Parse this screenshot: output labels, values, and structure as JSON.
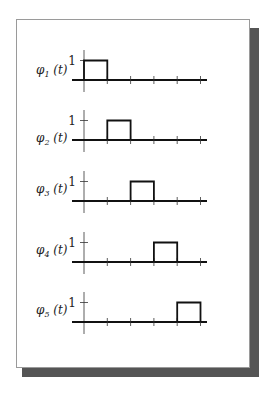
{
  "figure": {
    "colors": {
      "shadow": "#555555",
      "card_border": "#9a9a9a",
      "line": "#111111",
      "axis": "#333333"
    }
  },
  "chart_data": {
    "type": "line",
    "title": "",
    "x_ticks": 5,
    "ylim": [
      0,
      1
    ],
    "series": [
      {
        "name": "φ1 (t)",
        "symbol": "φ",
        "sub": "1",
        "arg": " (t)",
        "y_tick_label": "1",
        "pulse_start": 0,
        "pulse_end": 1,
        "height": 1
      },
      {
        "name": "φ2 (t)",
        "symbol": "φ",
        "sub": "2",
        "arg": " (t)",
        "y_tick_label": "1",
        "pulse_start": 1,
        "pulse_end": 2,
        "height": 1
      },
      {
        "name": "φ3 (t)",
        "symbol": "φ",
        "sub": "3",
        "arg": " (t)",
        "y_tick_label": "1",
        "pulse_start": 2,
        "pulse_end": 3,
        "height": 1
      },
      {
        "name": "φ4 (t)",
        "symbol": "φ",
        "sub": "4",
        "arg": " (t)",
        "y_tick_label": "1",
        "pulse_start": 3,
        "pulse_end": 4,
        "height": 1
      },
      {
        "name": "φ5 (t)",
        "symbol": "φ",
        "sub": "5",
        "arg": " (t)",
        "y_tick_label": "1",
        "pulse_start": 4,
        "pulse_end": 5,
        "height": 1
      }
    ]
  }
}
